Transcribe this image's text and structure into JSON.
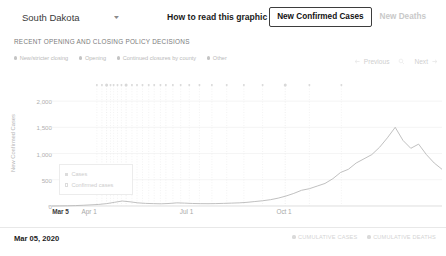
{
  "header": {
    "state_label": "South Dakota",
    "caret_icon": "chevron-down-icon",
    "how_to_read": "How to read this graphic",
    "metric_active": "New Confirmed Cases",
    "metric_inactive": "New Deaths"
  },
  "section": {
    "label": "RECENT OPENING AND CLOSING POLICY DECISIONS"
  },
  "policy_legend": [
    {
      "label": "New/stricter closing",
      "color": "#c4c4c4"
    },
    {
      "label": "Opening",
      "color": "#c4c4c4"
    },
    {
      "label": "Continued closures by county",
      "color": "#c4c4c4"
    },
    {
      "label": "Other",
      "color": "#c4c4c4"
    }
  ],
  "pager": {
    "previous_label": "Previous",
    "next_label": "Next",
    "prev_icon": "arrow-left-icon",
    "next_icon": "arrow-right-icon",
    "middle_icon": "search-icon"
  },
  "chart_legend": [
    {
      "label": "Cases",
      "style": "filled"
    },
    {
      "label": "Confirmed cases",
      "style": "hollow"
    }
  ],
  "footer": {
    "date": "Mar 05, 2020",
    "legend": [
      {
        "label": "CUMULATIVE CASES",
        "color": "#dadada"
      },
      {
        "label": "CUMULATIVE DEATHS",
        "color": "#dadada"
      }
    ]
  },
  "chart_data": {
    "type": "line",
    "title": "",
    "xlabel": "",
    "ylabel": "New Confirmed Cases",
    "ylim": [
      0,
      2250
    ],
    "yticks": [
      0,
      500,
      1000,
      1500,
      2000
    ],
    "ytick_labels": [
      "0",
      "500",
      "1,000",
      "1,500",
      "2,000"
    ],
    "xticks": [
      {
        "label": "Mar 5",
        "pos": 0.022,
        "emphasis": true
      },
      {
        "label": "Apr 1",
        "pos": 0.095,
        "emphasis": false
      },
      {
        "label": "Jul 1",
        "pos": 0.345,
        "emphasis": false
      },
      {
        "label": "Oct 1",
        "pos": 0.595,
        "emphasis": false
      }
    ],
    "grid": true,
    "legend_position": "inside-left",
    "line_color": "#b9b9b9",
    "series": [
      {
        "name": "New confirmed cases (7-day average)",
        "x": [
          0.0,
          0.02,
          0.04,
          0.06,
          0.08,
          0.1,
          0.12,
          0.14,
          0.16,
          0.18,
          0.2,
          0.22,
          0.24,
          0.26,
          0.28,
          0.3,
          0.32,
          0.34,
          0.36,
          0.38,
          0.4,
          0.42,
          0.44,
          0.46,
          0.48,
          0.5,
          0.52,
          0.54,
          0.56,
          0.58,
          0.6,
          0.62,
          0.64,
          0.66,
          0.68,
          0.7,
          0.72,
          0.74,
          0.76,
          0.78,
          0.8,
          0.82,
          0.84,
          0.86,
          0.88,
          0.9,
          0.92,
          0.94,
          0.96,
          0.98,
          1.0
        ],
        "values": [
          0,
          2,
          4,
          8,
          14,
          22,
          30,
          45,
          70,
          95,
          80,
          60,
          50,
          45,
          42,
          48,
          60,
          55,
          48,
          45,
          44,
          46,
          50,
          55,
          60,
          70,
          85,
          100,
          120,
          150,
          190,
          240,
          300,
          330,
          380,
          430,
          520,
          640,
          700,
          820,
          900,
          980,
          1120,
          1300,
          1500,
          1250,
          1100,
          1180,
          980,
          820,
          700
        ]
      }
    ],
    "event_markers": {
      "count": 26,
      "row_y_fraction": 0.06,
      "dot_color": "#d8d8d8",
      "line_color": "#e6e6e6"
    }
  }
}
